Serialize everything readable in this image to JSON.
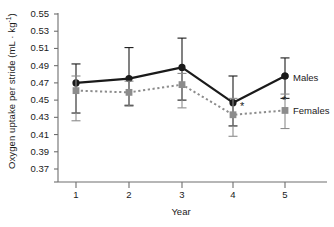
{
  "chart_data": {
    "type": "line",
    "title": "",
    "xlabel": "Year",
    "ylabel": "Oxygen uptake per stride (mL · kg",
    "ylabel_sup": "-1",
    "ylabel_close": ")",
    "categories": [
      "1",
      "2",
      "3",
      "4",
      "5"
    ],
    "x": [
      1,
      2,
      3,
      4,
      5
    ],
    "ylim": [
      0.37,
      0.55
    ],
    "yticks": [
      "0.55",
      "0.53",
      "0.51",
      "0.49",
      "0.47",
      "0.45",
      "0.43",
      "0.41",
      "0.39",
      "0.37"
    ],
    "ytick_values": [
      0.55,
      0.53,
      0.51,
      0.49,
      0.47,
      0.45,
      0.43,
      0.41,
      0.39,
      0.37
    ],
    "grid": false,
    "legend_position": "inline-right",
    "series": [
      {
        "name": "Males",
        "marker": "circle",
        "color": "#1a1a1a",
        "linestyle": "solid",
        "values": [
          0.47,
          0.475,
          0.488,
          0.447,
          0.478
        ],
        "err_upper": [
          0.492,
          0.511,
          0.522,
          0.478,
          0.499
        ],
        "err_lower": [
          0.435,
          0.444,
          0.45,
          0.42,
          0.452
        ],
        "significance": [
          "",
          "",
          "",
          "",
          ""
        ]
      },
      {
        "name": "Females",
        "marker": "square",
        "color": "#8c8c8c",
        "linestyle": "dotted",
        "values": [
          0.461,
          0.459,
          0.468,
          0.433,
          0.438
        ],
        "err_upper": [
          0.478,
          0.472,
          0.481,
          0.452,
          0.457
        ],
        "err_lower": [
          0.426,
          0.443,
          0.441,
          0.408,
          0.417
        ],
        "significance": [
          "",
          "",
          "",
          "*",
          "*"
        ]
      }
    ],
    "annotations": [
      {
        "text": "*",
        "series": "Females",
        "x": 4
      },
      {
        "text": "*",
        "series": "Females",
        "x": 5
      }
    ]
  },
  "labels": {
    "males": "Males",
    "females": "Females",
    "xaxis": "Year",
    "yaxis_main": "Oxygen uptake per stride (mL · kg",
    "yaxis_sup": "-1",
    "yaxis_end": ")"
  },
  "colors": {
    "males": "#1a1a1a",
    "females": "#8c8c8c",
    "axis": "#6e6e6e",
    "background": "#ffffff"
  }
}
